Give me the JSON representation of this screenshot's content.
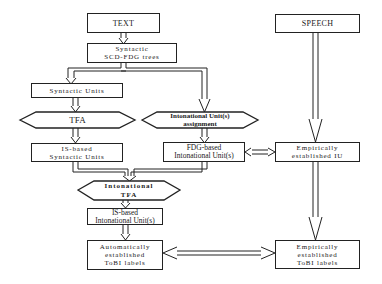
{
  "diagram": {
    "nodes": {
      "text": {
        "label": "TEXT"
      },
      "speech": {
        "label": "SPEECH"
      },
      "syntactic_trees": {
        "line1": "Syntactic",
        "line2": "SCD-FDG trees"
      },
      "syntactic_units": {
        "label": "Syntactic Units"
      },
      "tfa": {
        "label": "TFA"
      },
      "iu_assignment": {
        "line1": "Intonational Unit(s)",
        "line2": "assignment"
      },
      "is_syntactic_units": {
        "line1": "IS-based",
        "line2": "Syntactic Units"
      },
      "fdg_iu": {
        "line1": "FDG-based",
        "line2": "Intonational Unit(s)"
      },
      "empirical_iu": {
        "line1": "Empirically",
        "line2": "established IU"
      },
      "intonational_tfa": {
        "line1": "Intonational",
        "line2": "TFA"
      },
      "is_iu": {
        "line1": "IS-based",
        "line2": "Intonational Unit(s)"
      },
      "auto_tobi": {
        "line1": "Automatically",
        "line2": "established",
        "line3": "ToBI labels"
      },
      "empirical_tobi": {
        "line1": "Empirically",
        "line2": "established",
        "line3": "ToBI labels"
      }
    },
    "edges": [
      {
        "from": "TEXT",
        "to": "Syntactic SCD-FDG trees"
      },
      {
        "from": "Syntactic SCD-FDG trees",
        "to": "Syntactic Units"
      },
      {
        "from": "Syntactic SCD-FDG trees",
        "to": "Intonational Unit(s) assignment"
      },
      {
        "from": "Syntactic Units",
        "to": "TFA"
      },
      {
        "from": "TFA",
        "to": "IS-based Syntactic Units"
      },
      {
        "from": "Intonational Unit(s) assignment",
        "to": "FDG-based Intonational Unit(s)"
      },
      {
        "from": "FDG-based Intonational Unit(s)",
        "to": "Empirically established IU",
        "bidirectional": true
      },
      {
        "from": "IS-based Syntactic Units",
        "to": "Intonational TFA"
      },
      {
        "from": "FDG-based Intonational Unit(s)",
        "to": "Intonational TFA"
      },
      {
        "from": "Intonational TFA",
        "to": "IS-based Intonational Unit(s)"
      },
      {
        "from": "IS-based Intonational Unit(s)",
        "to": "Automatically established ToBI labels"
      },
      {
        "from": "SPEECH",
        "to": "Empirically established IU"
      },
      {
        "from": "Empirically established IU",
        "to": "Empirically established ToBI labels"
      },
      {
        "from": "Automatically established ToBI labels",
        "to": "Empirically established ToBI labels",
        "bidirectional": true
      }
    ]
  }
}
